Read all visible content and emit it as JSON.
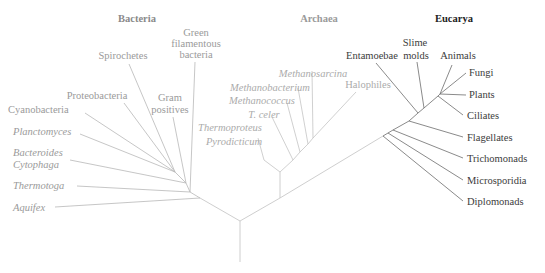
{
  "diagram": {
    "type": "phylogenetic-tree",
    "domains": [
      {
        "name": "Bacteria",
        "color": "#8a8a8a"
      },
      {
        "name": "Archaea",
        "color": "#9a9a9a"
      },
      {
        "name": "Eucarya",
        "color": "#222222"
      }
    ],
    "bacteria": {
      "title": "Bacteria",
      "taxa": [
        {
          "line1": "Green",
          "line2": "filamentous",
          "line3": "bacteria",
          "italic": false
        },
        {
          "label": "Spirochetes",
          "italic": false
        },
        {
          "label": "Proteobacteria",
          "italic": false
        },
        {
          "line1": "Gram",
          "line2": "positives",
          "italic": false
        },
        {
          "label": "Cyanobacteria",
          "italic": false
        },
        {
          "label": "Planctomyces",
          "italic": true
        },
        {
          "line1": "Bacteroides",
          "line2": "Cytophaga",
          "italic": true
        },
        {
          "label": "Thermotoga",
          "italic": true
        },
        {
          "label": "Aquifex",
          "italic": true
        }
      ]
    },
    "archaea": {
      "title": "Archaea",
      "taxa": [
        {
          "label": "Methanosarcina",
          "italic": true
        },
        {
          "label": "Methanobacterium",
          "italic": true
        },
        {
          "label": "Methanococcus",
          "italic": true
        },
        {
          "label": "T. celer",
          "italic": true
        },
        {
          "label": "Thermoproteus",
          "italic": true
        },
        {
          "label": "Pyrodicticum",
          "italic": true
        },
        {
          "label": "Halophiles",
          "italic": false
        }
      ]
    },
    "eucarya": {
      "title": "Eucarya",
      "taxa": [
        {
          "label": "Entamoebae"
        },
        {
          "line1": "Slime",
          "line2": "molds"
        },
        {
          "label": "Animals"
        },
        {
          "label": "Fungi"
        },
        {
          "label": "Plants"
        },
        {
          "label": "Ciliates"
        },
        {
          "label": "Flagellates"
        },
        {
          "label": "Trichomonads"
        },
        {
          "label": "Microsporidia"
        },
        {
          "label": "Diplomonads"
        }
      ]
    }
  }
}
